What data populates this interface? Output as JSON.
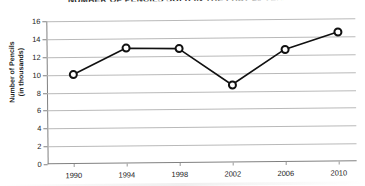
{
  "chart_data": {
    "type": "line",
    "title": "NUMBER OF PENCILS SOLD IN THE PAST 20 YEARS",
    "xlabel": "",
    "ylabel": "Number of Pencils\n(in thousands)",
    "ylabel_line1": "Number of Pencils",
    "ylabel_line2": "(in thousands)",
    "categories": [
      "1990",
      "1994",
      "1998",
      "2002",
      "2006",
      "2010"
    ],
    "x": [
      1990,
      1994,
      1998,
      2002,
      2006,
      2010
    ],
    "values": [
      10.0,
      12.9,
      12.8,
      8.7,
      12.6,
      14.5
    ],
    "series": [
      {
        "name": "Pencils sold",
        "values": [
          10.0,
          12.9,
          12.8,
          8.7,
          12.6,
          14.5
        ]
      }
    ],
    "ylim": [
      0,
      16
    ],
    "yticks": [
      0,
      2,
      4,
      6,
      8,
      10,
      12,
      14,
      16
    ],
    "ytick_labels": [
      "0",
      "2",
      "4",
      "6",
      "8",
      "10",
      "12",
      "14",
      "16"
    ],
    "xtick_labels": [
      "1990",
      "1994",
      "1998",
      "2002",
      "2006",
      "2010"
    ],
    "grid": true,
    "grid_axis": "y",
    "legend": false,
    "legend_position": "none",
    "marker": "open-circle",
    "line_color": "#111111",
    "marker_face_color": "#ffffff",
    "marker_edge_color": "#111111",
    "grid_color": "#b9b9b9",
    "axis_color": "#808080",
    "background_color": "#ffffff"
  }
}
